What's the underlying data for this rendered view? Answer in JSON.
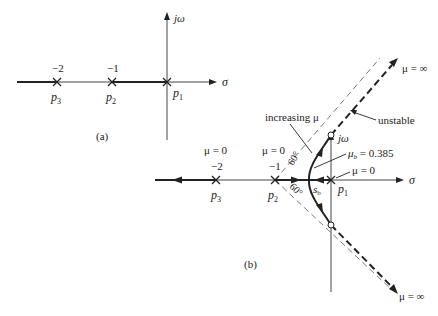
{
  "diagram_a": {
    "caption": "(a)",
    "axis_sigma": "σ",
    "axis_jw": "jω",
    "poles": [
      {
        "name": "p",
        "sub": "3",
        "value": "−2"
      },
      {
        "name": "p",
        "sub": "2",
        "value": "−1"
      },
      {
        "name": "p",
        "sub": "1",
        "value": ""
      }
    ]
  },
  "diagram_b": {
    "caption": "(b)",
    "axis_sigma": "σ",
    "axis_jw": "jω",
    "poles": [
      {
        "name": "p",
        "sub": "3",
        "value": "−2",
        "mu": "μ = 0"
      },
      {
        "name": "p",
        "sub": "2",
        "value": "−1",
        "mu": "μ = 0"
      },
      {
        "name": "p",
        "sub": "1",
        "value": "",
        "mu": "μ = 0"
      }
    ],
    "breakaway": {
      "name": "s",
      "sub": "b",
      "mu_label": "μ",
      "mu_sub": "b",
      "mu_value": " = 0.385"
    },
    "angles": [
      "60°",
      "60°"
    ],
    "annotations": {
      "increasing": "increasing μ",
      "unstable": "unstable",
      "mu_inf_top": "μ = ∞",
      "mu_inf_bottom": "μ = ∞"
    }
  }
}
